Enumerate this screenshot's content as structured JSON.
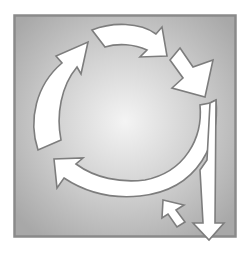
{
  "diagram": {
    "type": "cycle-arrows",
    "colors": {
      "page_background": "#ffffff",
      "frame_border": "#8a8a8a",
      "panel_center": "#f2f2f2",
      "panel_edge": "#a9a9a9",
      "arrow_fill": "#ffffff",
      "arrow_stroke": "#7d7d7d"
    },
    "arrows": [
      {
        "id": "left-arc-up",
        "direction": "up-right"
      },
      {
        "id": "top-arc-right",
        "direction": "right"
      },
      {
        "id": "top-right-down",
        "direction": "down-right"
      },
      {
        "id": "bottom-arc-left",
        "direction": "left"
      },
      {
        "id": "exit-down",
        "direction": "down"
      },
      {
        "id": "small-return",
        "direction": "up-left"
      }
    ]
  }
}
